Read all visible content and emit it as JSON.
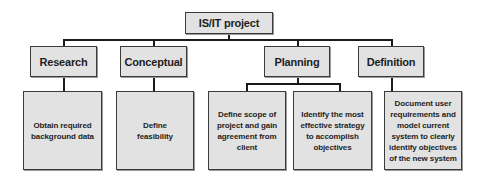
{
  "diagram": {
    "type": "hierarchy",
    "root": {
      "label": "IS/IT project"
    },
    "phases": [
      {
        "label": "Research",
        "children": [
          "Obtain required background data"
        ]
      },
      {
        "label": "Conceptual",
        "children": [
          "Define feasibility"
        ]
      },
      {
        "label": "Planning",
        "children": [
          "Define scope of project and gain agreement from client",
          "Identify the most effective strategy to accomplish objectives"
        ]
      },
      {
        "label": "Definition",
        "children": [
          "Document user requirements and model current system to clearly identify objectives of the new system"
        ]
      }
    ],
    "colors": {
      "box_fill": "#e2e2e2",
      "box_border": "#3a3a3a",
      "connector": "#1a1a1a",
      "text": "#1e1e1e"
    }
  }
}
